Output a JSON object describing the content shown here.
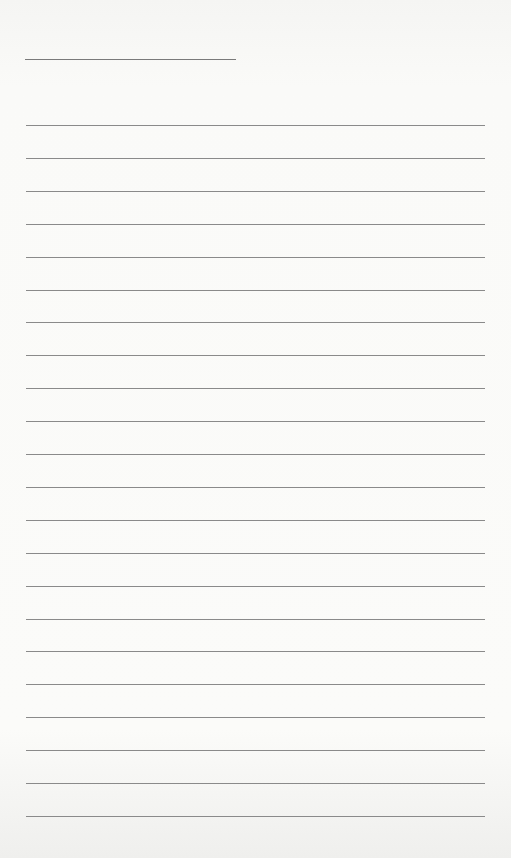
{
  "page": {
    "type": "blank lined notebook page",
    "title_line": {
      "present": true
    },
    "ruled_lines": {
      "count": 22,
      "first_y": 125,
      "spacing": 32.9
    },
    "colors": {
      "paper": "#fafaf8",
      "line": "#8a8a8a"
    }
  }
}
